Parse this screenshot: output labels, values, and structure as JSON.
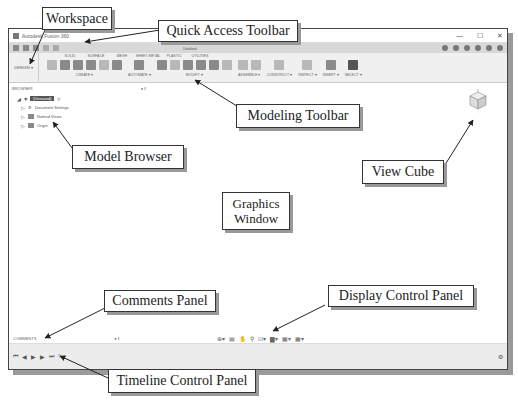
{
  "figure": {
    "caption_fragment": "Window Areas."
  },
  "window": {
    "title": "Autodesk Fusion 360",
    "controls": [
      "—",
      "☐",
      "✕"
    ],
    "qat_tab_label": "Untitled",
    "workspace_label": "DESIGN ▾"
  },
  "ribbon": {
    "tabs": [
      "SOLID",
      "SURFACE",
      "MESH",
      "SHEET METAL",
      "PLASTIC",
      "UTILITIES"
    ],
    "groups": [
      {
        "label": "CREATE ▾"
      },
      {
        "label": "AUTOMATE ▾"
      },
      {
        "label": "MODIFY ▾"
      },
      {
        "label": "ASSEMBLE ▾"
      },
      {
        "label": "CONSTRUCT ▾"
      },
      {
        "label": "INSPECT ▾"
      },
      {
        "label": "INSERT ▾"
      },
      {
        "label": "SELECT ▾"
      }
    ]
  },
  "browser": {
    "header": "BROWSER",
    "root": "(Unsaved)",
    "items": [
      "Document Settings",
      "Named Views",
      "Origin"
    ]
  },
  "comments": {
    "label": "COMMENTS"
  },
  "timeline": {
    "controls": [
      "⏮",
      "◀",
      "▶",
      "▶",
      "⏭"
    ]
  },
  "callouts": {
    "workspace": "Workspace",
    "quick_access_toolbar": "Quick Access Toolbar",
    "modeling_toolbar": "Modeling Toolbar",
    "model_browser": "Model Browser",
    "view_cube": "View Cube",
    "graphics_window_line1": "Graphics",
    "graphics_window_line2": "Window",
    "comments_panel": "Comments Panel",
    "display_control_panel": "Display Control Panel",
    "timeline_control_panel": "Timeline Control Panel"
  }
}
